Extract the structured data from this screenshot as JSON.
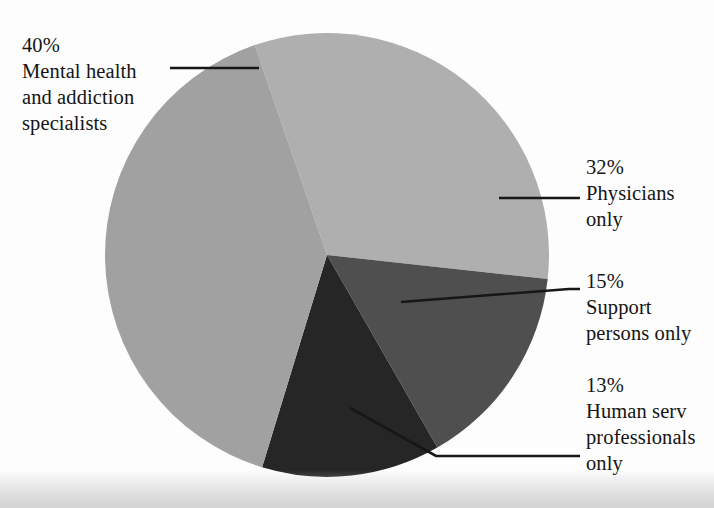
{
  "chart_data": {
    "type": "pie",
    "title": "",
    "subtitle": "",
    "xlabel": "",
    "ylabel": "",
    "legend_position": "callout-labels",
    "grid": false,
    "units": "percent",
    "total": 100,
    "categories": [
      "Mental health and addiction specialists",
      "Physicians only",
      "Support persons only",
      "Human service professionals only"
    ],
    "values": [
      40,
      32,
      15,
      13
    ],
    "colors": [
      "#a1a1a1",
      "#afafaf",
      "#4f4f4f",
      "#262626"
    ],
    "slices": [
      {
        "label": "Mental health and addiction specialists",
        "value": 40,
        "value_text": "40%",
        "color": "#a1a1a1",
        "label_lines": [
          "Mental health",
          "and addiction",
          "specialists"
        ]
      },
      {
        "label": "Physicians only",
        "value": 32,
        "value_text": "32%",
        "color": "#afafaf",
        "label_lines": [
          "Physicians",
          "only"
        ]
      },
      {
        "label": "Support persons only",
        "value": 15,
        "value_text": "15%",
        "color": "#4f4f4f",
        "label_lines": [
          "Support",
          "persons only"
        ]
      },
      {
        "label": "Human service professionals only",
        "value": 13,
        "value_text": "13%",
        "color": "#262626",
        "label_lines": [
          "Human serv",
          "professionals",
          "only"
        ]
      }
    ]
  },
  "labels": {
    "mental_health": {
      "pct": "40%",
      "line1": "Mental health",
      "line2": "and addiction",
      "line3": "specialists"
    },
    "physicians": {
      "pct": "32%",
      "line1": "Physicians",
      "line2": "only"
    },
    "support": {
      "pct": "15%",
      "line1": "Support",
      "line2": "persons only"
    },
    "human_services": {
      "pct": "13%",
      "line1": "Human serv",
      "line2": "professionals",
      "line3": "only"
    }
  }
}
